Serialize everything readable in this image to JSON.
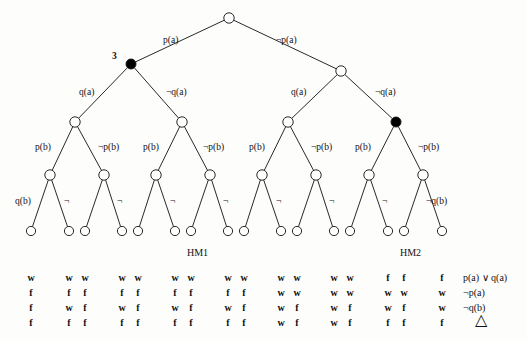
{
  "figure": {
    "type": "semantic-tableau-tree",
    "marked_node_index_label": "3"
  },
  "tree": {
    "levels": 5,
    "leaf_count": 16,
    "nodes": [
      {
        "id": "n0",
        "level": 0,
        "x": 229,
        "y": 18,
        "filled": false
      },
      {
        "id": "n1",
        "level": 1,
        "x": 131,
        "y": 64,
        "filled": true
      },
      {
        "id": "n2",
        "level": 1,
        "x": 341,
        "y": 71,
        "filled": false
      },
      {
        "id": "n11",
        "level": 2,
        "x": 75,
        "y": 122,
        "filled": false
      },
      {
        "id": "n12",
        "level": 2,
        "x": 182,
        "y": 122,
        "filled": false
      },
      {
        "id": "n21",
        "level": 2,
        "x": 288,
        "y": 122,
        "filled": false
      },
      {
        "id": "n22",
        "level": 2,
        "x": 396,
        "y": 122,
        "filled": true
      },
      {
        "id": "n111",
        "level": 3,
        "x": 50,
        "y": 175,
        "filled": false
      },
      {
        "id": "n112",
        "level": 3,
        "x": 104,
        "y": 175,
        "filled": false
      },
      {
        "id": "n121",
        "level": 3,
        "x": 156,
        "y": 175,
        "filled": false
      },
      {
        "id": "n122",
        "level": 3,
        "x": 210,
        "y": 175,
        "filled": false
      },
      {
        "id": "n211",
        "level": 3,
        "x": 262,
        "y": 175,
        "filled": false
      },
      {
        "id": "n212",
        "level": 3,
        "x": 316,
        "y": 175,
        "filled": false
      },
      {
        "id": "n221",
        "level": 3,
        "x": 369,
        "y": 175,
        "filled": false
      },
      {
        "id": "n222",
        "level": 3,
        "x": 423,
        "y": 175,
        "filled": false
      },
      {
        "id": "l1",
        "level": 4,
        "x": 31,
        "y": 231,
        "filled": false
      },
      {
        "id": "l2",
        "level": 4,
        "x": 69,
        "y": 231,
        "filled": false
      },
      {
        "id": "l3",
        "level": 4,
        "x": 85,
        "y": 231,
        "filled": false
      },
      {
        "id": "l4",
        "level": 4,
        "x": 122,
        "y": 231,
        "filled": false
      },
      {
        "id": "l5",
        "level": 4,
        "x": 138,
        "y": 231,
        "filled": false
      },
      {
        "id": "l6",
        "level": 4,
        "x": 175,
        "y": 231,
        "filled": false
      },
      {
        "id": "l7",
        "level": 4,
        "x": 191,
        "y": 231,
        "filled": false
      },
      {
        "id": "l8",
        "level": 4,
        "x": 228,
        "y": 231,
        "filled": false
      },
      {
        "id": "l9",
        "level": 4,
        "x": 244,
        "y": 231,
        "filled": false
      },
      {
        "id": "l10",
        "level": 4,
        "x": 281,
        "y": 231,
        "filled": false
      },
      {
        "id": "l11",
        "level": 4,
        "x": 297,
        "y": 231,
        "filled": false
      },
      {
        "id": "l12",
        "level": 4,
        "x": 334,
        "y": 231,
        "filled": false
      },
      {
        "id": "l13",
        "level": 4,
        "x": 350,
        "y": 231,
        "filled": false
      },
      {
        "id": "l14",
        "level": 4,
        "x": 388,
        "y": 231,
        "filled": false
      },
      {
        "id": "l15",
        "level": 4,
        "x": 404,
        "y": 231,
        "filled": false
      },
      {
        "id": "l16",
        "level": 4,
        "x": 442,
        "y": 231,
        "filled": false
      }
    ],
    "edges": [
      {
        "from": "n0",
        "to": "n1"
      },
      {
        "from": "n0",
        "to": "n2"
      },
      {
        "from": "n1",
        "to": "n11"
      },
      {
        "from": "n1",
        "to": "n12"
      },
      {
        "from": "n2",
        "to": "n21"
      },
      {
        "from": "n2",
        "to": "n22"
      },
      {
        "from": "n11",
        "to": "n111"
      },
      {
        "from": "n11",
        "to": "n112"
      },
      {
        "from": "n12",
        "to": "n121"
      },
      {
        "from": "n12",
        "to": "n122"
      },
      {
        "from": "n21",
        "to": "n211"
      },
      {
        "from": "n21",
        "to": "n212"
      },
      {
        "from": "n22",
        "to": "n221"
      },
      {
        "from": "n22",
        "to": "n222"
      },
      {
        "from": "n111",
        "to": "l1"
      },
      {
        "from": "n111",
        "to": "l2"
      },
      {
        "from": "n112",
        "to": "l3"
      },
      {
        "from": "n112",
        "to": "l4"
      },
      {
        "from": "n121",
        "to": "l5"
      },
      {
        "from": "n121",
        "to": "l6"
      },
      {
        "from": "n122",
        "to": "l7"
      },
      {
        "from": "n122",
        "to": "l8"
      },
      {
        "from": "n211",
        "to": "l9"
      },
      {
        "from": "n211",
        "to": "l10"
      },
      {
        "from": "n212",
        "to": "l11"
      },
      {
        "from": "n212",
        "to": "l12"
      },
      {
        "from": "n221",
        "to": "l13"
      },
      {
        "from": "n221",
        "to": "l14"
      },
      {
        "from": "n222",
        "to": "l15"
      },
      {
        "from": "n222",
        "to": "l16"
      }
    ],
    "edge_labels": [
      {
        "id": "el-pa",
        "text": "p(a)",
        "x": 163,
        "y": 36
      },
      {
        "id": "el-not-pa",
        "text": "¬p(a)",
        "x": 276,
        "y": 36
      },
      {
        "id": "el-qa-1",
        "text": "q(a)",
        "x": 79,
        "y": 88
      },
      {
        "id": "el-not-qa-1",
        "text": "¬q(a)",
        "x": 166,
        "y": 88
      },
      {
        "id": "el-qa-2",
        "text": "q(a)",
        "x": 291,
        "y": 88
      },
      {
        "id": "el-not-qa-2",
        "text": "¬q(a)",
        "x": 375,
        "y": 88
      },
      {
        "id": "el-pb-1",
        "text": "p(b)",
        "x": 35,
        "y": 143
      },
      {
        "id": "el-not-pb-1",
        "text": "¬p(b)",
        "x": 98,
        "y": 143
      },
      {
        "id": "el-pb-2",
        "text": "p(b)",
        "x": 143,
        "y": 143
      },
      {
        "id": "el-not-pb-2",
        "text": "¬p(b)",
        "x": 203,
        "y": 143
      },
      {
        "id": "el-pb-3",
        "text": "p(b)",
        "x": 249,
        "y": 143
      },
      {
        "id": "el-not-pb-3",
        "text": "¬p(b)",
        "x": 311,
        "y": 143
      },
      {
        "id": "el-pb-4",
        "text": "p(b)",
        "x": 355,
        "y": 143
      },
      {
        "id": "el-not-pb-4",
        "text": "¬p(b)",
        "x": 418,
        "y": 143
      }
    ],
    "leaf_edge_labels": [
      {
        "id": "le-qb",
        "text": "q(b)",
        "x": 15,
        "y": 197
      },
      {
        "id": "le-neg-1",
        "text": "¬",
        "x": 64,
        "y": 197
      },
      {
        "id": "le-neg-2",
        "text": "¬",
        "x": 117,
        "y": 197
      },
      {
        "id": "le-neg-3",
        "text": "¬",
        "x": 170,
        "y": 197
      },
      {
        "id": "le-neg-4",
        "text": "¬",
        "x": 223,
        "y": 197
      },
      {
        "id": "le-neg-5",
        "text": "¬",
        "x": 276,
        "y": 197
      },
      {
        "id": "le-neg-6",
        "text": "¬",
        "x": 329,
        "y": 197
      },
      {
        "id": "le-neg-7",
        "text": "¬",
        "x": 382,
        "y": 197
      },
      {
        "id": "le-not-qb",
        "text": "¬q(b)",
        "x": 426,
        "y": 197
      }
    ]
  },
  "table": {
    "headers": [
      {
        "id": "hm1",
        "label": "HM1",
        "x": 187
      },
      {
        "id": "hm2",
        "label": "HM2",
        "x": 400
      }
    ],
    "column_x": [
      31,
      69,
      85,
      122,
      138,
      175,
      191,
      228,
      244,
      281,
      297,
      334,
      350,
      388,
      404,
      442
    ],
    "row_y": [
      25,
      40,
      55,
      70
    ],
    "rows": [
      {
        "formula": "p(a) ∨ q(a)",
        "values": [
          "w",
          "w",
          "w",
          "w",
          "w",
          "w",
          "w",
          "w",
          "w",
          "w",
          "w",
          "w",
          "w",
          "f",
          "f",
          "f"
        ]
      },
      {
        "formula": "¬p(a)",
        "values": [
          "f",
          "f",
          "f",
          "f",
          "f",
          "f",
          "f",
          "f",
          "f",
          "w",
          "w",
          "w",
          "w",
          "w",
          "w",
          "w"
        ]
      },
      {
        "formula": "¬q(b)",
        "values": [
          "f",
          "w",
          "f",
          "w",
          "f",
          "w",
          "f",
          "w",
          "f",
          "w",
          "f",
          "w",
          "f",
          "w",
          "f",
          "w"
        ]
      },
      {
        "formula": "△",
        "values": [
          "f",
          "f",
          "f",
          "f",
          "f",
          "f",
          "f",
          "f",
          "f",
          "w",
          "f",
          "w",
          "f",
          "f",
          "f",
          "f"
        ]
      }
    ],
    "formula_x": 463,
    "last_col_x": 442
  },
  "colors": {
    "ink": "#111111",
    "background": "#fdfdfc",
    "node_fill": "#ffffff",
    "node_filled": "#000000"
  }
}
